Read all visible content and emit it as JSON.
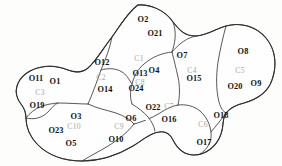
{
  "figure": {
    "type": "region-partition-diagram",
    "background_color": "#fdfdfc",
    "stroke_color": "#3a3a3a",
    "object_label_color": "#111111",
    "cluster_label_color": "#a8a8a8"
  },
  "clusters": [
    {
      "id": "c1",
      "label": "C1",
      "x": 139,
      "y": 59,
      "objects": [
        {
          "label": "O2",
          "x": 143,
          "y": 20
        },
        {
          "label": "O21",
          "x": 155,
          "y": 34
        },
        {
          "label": "O13",
          "x": 140,
          "y": 74
        }
      ]
    },
    {
      "id": "c2",
      "label": "C2",
      "x": 101,
      "y": 78,
      "objects": [
        {
          "label": "O12",
          "x": 102,
          "y": 63
        },
        {
          "label": "O14",
          "x": 105,
          "y": 90
        }
      ]
    },
    {
      "id": "c3",
      "label": "C3",
      "x": 40,
      "y": 93,
      "objects": [
        {
          "label": "O11",
          "x": 36,
          "y": 79
        },
        {
          "label": "O1",
          "x": 55,
          "y": 82
        },
        {
          "label": "O19",
          "x": 37,
          "y": 106
        }
      ]
    },
    {
      "id": "c4",
      "label": "C4",
      "x": 192,
      "y": 71,
      "objects": [
        {
          "label": "O7",
          "x": 182,
          "y": 56
        },
        {
          "label": "O15",
          "x": 194,
          "y": 79
        }
      ]
    },
    {
      "id": "c5",
      "label": "C5",
      "x": 240,
      "y": 71,
      "objects": [
        {
          "label": "O8",
          "x": 243,
          "y": 52
        },
        {
          "label": "O20",
          "x": 235,
          "y": 87
        },
        {
          "label": "O9",
          "x": 256,
          "y": 84
        }
      ]
    },
    {
      "id": "c6",
      "label": "C6",
      "x": 203,
      "y": 125,
      "objects": [
        {
          "label": "O18",
          "x": 221,
          "y": 116
        },
        {
          "label": "O17",
          "x": 204,
          "y": 143
        }
      ]
    },
    {
      "id": "c7",
      "label": "C7",
      "x": 169,
      "y": 107,
      "objects": [
        {
          "label": "O22",
          "x": 153,
          "y": 108
        },
        {
          "label": "O16",
          "x": 169,
          "y": 120
        }
      ]
    },
    {
      "id": "c8",
      "label": "C8",
      "x": 140,
      "y": 83,
      "objects": [
        {
          "label": "O4",
          "x": 154,
          "y": 71
        },
        {
          "label": "O24",
          "x": 136,
          "y": 89
        }
      ]
    },
    {
      "id": "c9",
      "label": "C9",
      "x": 119,
      "y": 127,
      "objects": [
        {
          "label": "O6",
          "x": 131,
          "y": 119
        },
        {
          "label": "O10",
          "x": 116,
          "y": 140
        }
      ]
    },
    {
      "id": "c10",
      "label": "C10",
      "x": 74,
      "y": 127,
      "objects": [
        {
          "label": "O3",
          "x": 76,
          "y": 117
        },
        {
          "label": "O23",
          "x": 56,
          "y": 131
        },
        {
          "label": "O5",
          "x": 71,
          "y": 144
        }
      ]
    }
  ],
  "geometry": {
    "outer_boundary": "M 138 5 C 150 4 165 10 173 22 C 180 31 185 36 196 36 C 208 35 215 29 226 26 C 240 22 256 26 266 38 C 276 50 277 66 272 80 C 268 92 258 99 244 103 C 236 105 230 108 226 113 C 222 119 224 126 221 134 C 217 146 206 155 194 155 C 184 155 177 148 173 140 C 170 134 166 131 159 132 C 150 133 143 140 133 146 C 118 155 100 161 82 161 C 64 161 48 155 38 145 C 30 137 26 127 26 118 C 26 112 24 108 21 104 C 17 99 15 93 17 86 C 20 76 30 69 42 67 C 52 65 60 67 68 70 C 76 73 82 73 88 68 C 96 61 102 50 112 37 C 120 26 128 12 138 5 Z",
    "internal_edges": [
      "M 88 68 C 96 61 102 50 112 37 C 120 26 128 12 138 5",
      "M 112 37 C 110 48 106 58 101 70 C 96 84 92 95 88 104",
      "M 88 104 C 80 104 68 103 58 103 C 46 104 34 107 26 118",
      "M 88 104 C 96 108 106 110 116 113 C 124 116 130 119 134 124",
      "M 134 124 C 128 132 118 140 108 146 C 100 151 90 156 82 161",
      "M 134 124 C 142 122 152 118 160 113 C 166 109 172 106 178 105",
      "M 178 105 C 186 104 194 106 200 111 C 206 116 210 124 211 132 C 212 141 208 149 200 154",
      "M 178 105 C 180 96 180 86 178 77 C 176 68 174 60 172 52",
      "M 172 52 C 178 45 184 40 192 37 C 196 36 196 36 196 36",
      "M 172 52 C 162 53 152 57 144 64 C 138 69 134 76 132 84 C 130 92 130 98 132 104",
      "M 132 104 C 138 108 144 112 148 117 C 152 122 154 126 155 131",
      "M 101 70 C 108 68 116 68 122 72 C 126 74 128 78 132 84",
      "M 172 52 C 175 43 177 33 173 22",
      "M 226 26 C 223 37 220 50 218 62 C 216 76 216 90 219 102 C 221 109 223 111 226 113",
      "M 26 118 C 34 120 42 118 48 112 C 52 108 54 104 58 103",
      "M 211 132 C 216 126 221 120 226 113"
    ]
  }
}
